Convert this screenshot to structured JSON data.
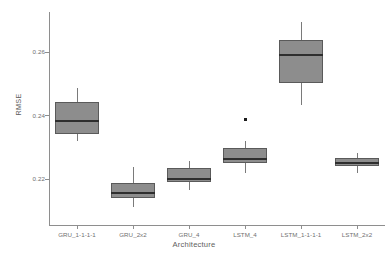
{
  "chart_data": {
    "type": "box",
    "title": "",
    "xlabel": "Architecture",
    "ylabel": "RMSE",
    "ylim": [
      0.2055,
      0.2725
    ],
    "yticks": [
      0.26,
      0.24,
      0.22
    ],
    "ytick_labels": [
      "0.26",
      "0.24",
      "0.22"
    ],
    "grid": false,
    "legend": "none",
    "categories": [
      "GRU_1-1-1-1",
      "GRU_2x2",
      "GRU_4",
      "LSTM_4",
      "LSTM_1-1-1-1",
      "LSTM_2x2"
    ],
    "boxes": [
      {
        "category": "GRU_1-1-1-1",
        "whisker_low": 0.2318,
        "q1": 0.234,
        "median": 0.2381,
        "q3": 0.2441,
        "whisker_high": 0.2487,
        "outliers": []
      },
      {
        "category": "GRU_2x2",
        "whisker_low": 0.2111,
        "q1": 0.2139,
        "median": 0.2155,
        "q3": 0.2186,
        "whisker_high": 0.2238,
        "outliers": []
      },
      {
        "category": "GRU_4",
        "whisker_low": 0.2164,
        "q1": 0.2189,
        "median": 0.22,
        "q3": 0.2233,
        "whisker_high": 0.2256,
        "outliers": []
      },
      {
        "category": "LSTM_4",
        "whisker_low": 0.2218,
        "q1": 0.2249,
        "median": 0.2264,
        "q3": 0.2297,
        "whisker_high": 0.2319,
        "outliers": [
          0.2388
        ]
      },
      {
        "category": "LSTM_1-1-1-1",
        "whisker_low": 0.2432,
        "q1": 0.2501,
        "median": 0.2591,
        "q3": 0.2638,
        "whisker_high": 0.2693,
        "outliers": []
      },
      {
        "category": "LSTM_2x2",
        "whisker_low": 0.2219,
        "q1": 0.224,
        "median": 0.225,
        "q3": 0.2265,
        "whisker_high": 0.2282,
        "outliers": []
      }
    ],
    "colors": {
      "box_fill": "#8d8d8d",
      "box_edge": "#5a5a5a",
      "median": "#2e2e2e",
      "whisker": "#7a7a7a",
      "outlier": "#1c1c1c",
      "axis": "#8e8e8e",
      "text": "#6f6f6f",
      "background": "#ffffff"
    }
  },
  "layout": {
    "plot_left": 49,
    "plot_right": 385,
    "plot_top": 12,
    "plot_bottom": 225,
    "box_width": 44
  }
}
